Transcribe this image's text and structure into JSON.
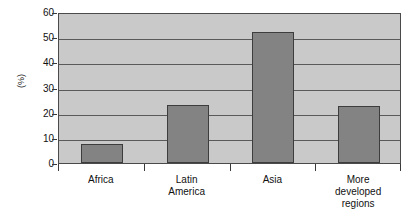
{
  "chart_data": {
    "type": "bar",
    "title": "",
    "xlabel": "",
    "ylabel": "(%)",
    "categories": [
      "Africa",
      "Latin America",
      "Asia",
      "More developed regions"
    ],
    "category_label_lines": [
      [
        "Africa"
      ],
      [
        "Latin",
        "America"
      ],
      [
        "Asia"
      ],
      [
        "More",
        "developed",
        "regions"
      ]
    ],
    "values": [
      7.5,
      23,
      52,
      22.5
    ],
    "ylim": [
      0,
      60
    ],
    "ytick_values": [
      0,
      10,
      20,
      30,
      40,
      50,
      60
    ],
    "ytick_labels": [
      "0",
      "10",
      "20",
      "30",
      "40",
      "50",
      "60"
    ],
    "grid": true,
    "legend": "none",
    "colors": {
      "bar_fill": "#838383",
      "bar_edge": "#3d3d3d",
      "plot_background": "#c9c9c9",
      "gridline": "#5a5a5a",
      "axis": "#4a4a4a",
      "text": "#111111",
      "page_background": "#ffffff"
    }
  }
}
